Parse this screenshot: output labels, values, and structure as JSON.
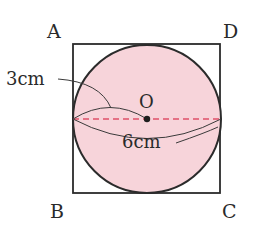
{
  "diagram": {
    "type": "geometry",
    "vertices": {
      "A": "A",
      "B": "B",
      "C": "C",
      "D": "D"
    },
    "center_label": "O",
    "radius_label": "3cm",
    "diameter_label": "6cm",
    "colors": {
      "circle_fill": "#f7d4da",
      "outline": "#2b2b2b",
      "dashed_diameter": "#e0506a"
    }
  }
}
